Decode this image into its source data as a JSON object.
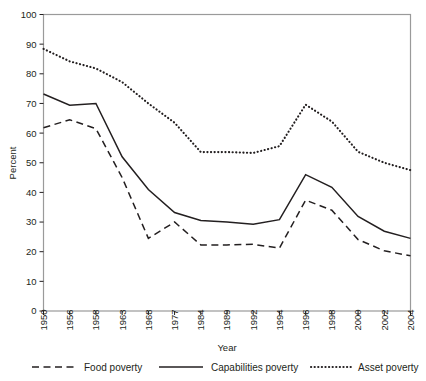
{
  "chart_data": {
    "type": "line",
    "title": "",
    "xlabel": "Year",
    "ylabel": "Percent",
    "ylim": [
      0,
      100
    ],
    "ytick_step": 10,
    "grid": false,
    "legend_position": "bottom",
    "categories": [
      "1950",
      "1956",
      "1958",
      "1963",
      "1968",
      "1977",
      "1984",
      "1989",
      "1992",
      "1994",
      "1996",
      "1998",
      "2000",
      "2002",
      "2004"
    ],
    "yticks": [
      "0",
      "10",
      "20",
      "30",
      "40",
      "50",
      "60",
      "70",
      "80",
      "90",
      "100"
    ],
    "xticks": [
      "1950",
      "1956",
      "1958",
      "1963",
      "1968",
      "1977",
      "1984",
      "1989",
      "1992",
      "1994",
      "1996",
      "1998",
      "2000",
      "2002",
      "2004"
    ],
    "series": [
      {
        "name": "Food poverty",
        "style": "dashed",
        "values": [
          61.8,
          64.5,
          61.5,
          45.0,
          24.5,
          30.0,
          22.3,
          22.3,
          22.5,
          21.2,
          37.4,
          34.0,
          24.1,
          20.3,
          18.6
        ]
      },
      {
        "name": "Capabilities poverty",
        "style": "solid",
        "values": [
          73.2,
          69.4,
          70.0,
          52.0,
          41.0,
          33.2,
          30.5,
          30.0,
          29.3,
          30.8,
          46.0,
          41.7,
          31.9,
          26.9,
          24.5
        ]
      },
      {
        "name": "Asset poverty",
        "style": "dotted",
        "values": [
          88.4,
          84.2,
          81.8,
          77.2,
          70.0,
          63.5,
          53.6,
          53.6,
          53.3,
          55.6,
          69.6,
          63.9,
          53.7,
          50.0,
          47.5
        ]
      }
    ]
  },
  "legend": {
    "items": [
      {
        "label": "Food poverty",
        "style": "dashed"
      },
      {
        "label": "Capabilities poverty",
        "style": "solid"
      },
      {
        "label": "Asset poverty",
        "style": "dotted"
      }
    ]
  },
  "axes": {
    "y_title": "Percent",
    "x_title": "Year"
  },
  "colors": {
    "ink": "#231f20",
    "frame": "#9a9a9a",
    "background": "#ffffff"
  }
}
